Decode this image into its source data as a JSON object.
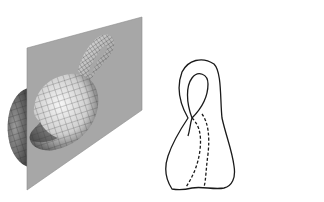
{
  "figure": {
    "left_panel": {
      "subject": "klein-bottle-cut-by-plane",
      "plane_color": "#a7a7a7",
      "plane_edge_color": "#8d8d8d",
      "surface_light": "#eeeeee",
      "surface_dark": "#3a3a3a",
      "mesh_color": "#2b2b2b"
    },
    "right_panel": {
      "subject": "two-mobius-strips",
      "items": [
        {
          "name": "mobius-strip-left",
          "mirrored": false
        },
        {
          "name": "mobius-strip-right",
          "mirrored": true
        }
      ],
      "stroke_color": "#1a1a1a",
      "hidden_line_style": "dashed"
    }
  }
}
